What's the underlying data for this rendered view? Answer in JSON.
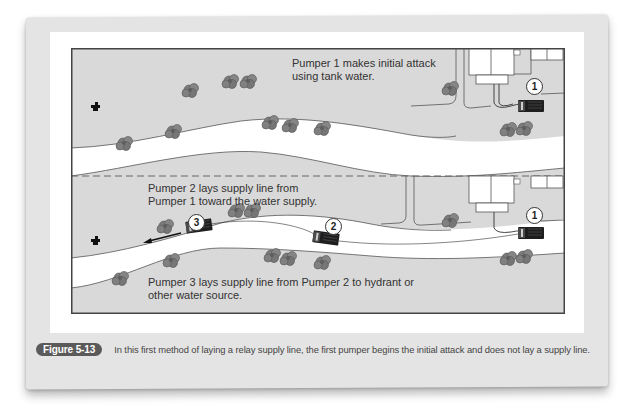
{
  "figure": {
    "badge": "Figure 5-13",
    "caption": "In this first method of laying a relay supply line, the first pumper begins the initial attack and does not lay a supply line."
  },
  "diagram": {
    "top_panel": {
      "label_line1": "Pumper 1 makes initial attack",
      "label_line2": "using tank water.",
      "markers": [
        "1"
      ]
    },
    "bottom_panel": {
      "label_top_line1": "Pumper 2 lays supply line from",
      "label_top_line2": "Pumper 1 toward the water supply.",
      "label_bottom_line1": "Pumper 3 lays supply line from Pumper 2 to hydrant or",
      "label_bottom_line2": "other water source.",
      "markers": [
        "3",
        "2",
        "1"
      ]
    },
    "colors": {
      "ground": "#d9d9d9",
      "road": "#ffffff",
      "frame": "#444444",
      "truck": "#2a2a2a",
      "bush": "#7a7a7a",
      "badge": "#5a5a5a"
    }
  }
}
